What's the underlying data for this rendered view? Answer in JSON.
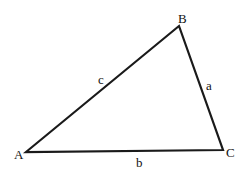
{
  "diagram": {
    "type": "triangle",
    "vertices": {
      "A": {
        "label": "A",
        "x": 26,
        "y": 152
      },
      "B": {
        "label": "B",
        "x": 179,
        "y": 26
      },
      "C": {
        "label": "C",
        "x": 223,
        "y": 150
      }
    },
    "sides": {
      "a": {
        "label": "a",
        "from": "B",
        "to": "C"
      },
      "b": {
        "label": "b",
        "from": "A",
        "to": "C"
      },
      "c": {
        "label": "c",
        "from": "A",
        "to": "B"
      }
    },
    "stroke_color": "#1a1a1a"
  }
}
